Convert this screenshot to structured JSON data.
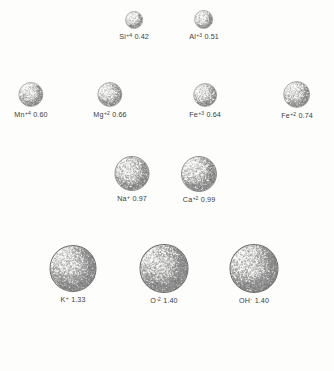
{
  "figure": {
    "background_color": "#fdfdfb",
    "text_color": "#3c3c3c",
    "sphere_outline_color": "#6b6b6b",
    "sphere_fill_color": "#fbfbf9",
    "sphere_stipple_color": "#8a8a8a",
    "scale_px_per_unit": 34.2
  },
  "chart_data": {
    "type": "scatter",
    "title": "",
    "xlabel": "",
    "ylabel": "",
    "rows": [
      {
        "row_index": 0,
        "y": 18,
        "ions": [
          {
            "symbol": "Si",
            "charge": "+4",
            "value": "0.42",
            "radius": 0.42,
            "cx": 134,
            "diameter": 17
          },
          {
            "symbol": "Al",
            "charge": "+3",
            "value": "0.51",
            "radius": 0.51,
            "cx": 204,
            "diameter": 18
          }
        ]
      },
      {
        "row_index": 1,
        "y": 93,
        "ions": [
          {
            "symbol": "Mn",
            "charge": "+4",
            "value": "0.60",
            "radius": 0.6,
            "cx": 31,
            "diameter": 24
          },
          {
            "symbol": "Mg",
            "charge": "+2",
            "value": "0.66",
            "radius": 0.66,
            "cx": 110,
            "diameter": 24
          },
          {
            "symbol": "Fe",
            "charge": "+3",
            "value": "0.64",
            "radius": 0.64,
            "cx": 205,
            "diameter": 23
          },
          {
            "symbol": "Fe",
            "charge": "+2",
            "value": "0.74",
            "radius": 0.74,
            "cx": 297,
            "diameter": 26
          }
        ]
      },
      {
        "row_index": 2,
        "y": 172,
        "ions": [
          {
            "symbol": "Na",
            "charge": "+",
            "value": "0.97",
            "radius": 0.97,
            "cx": 132,
            "diameter": 34
          },
          {
            "symbol": "Ca",
            "charge": "+2",
            "value": "0.99",
            "radius": 0.99,
            "cx": 199,
            "diameter": 35
          }
        ]
      },
      {
        "row_index": 3,
        "y": 267,
        "ions": [
          {
            "symbol": "K",
            "charge": "+",
            "value": "1.33",
            "radius": 1.33,
            "cx": 73,
            "diameter": 46
          },
          {
            "symbol": "O",
            "charge": "-2",
            "value": "1.40",
            "radius": 1.4,
            "cx": 164,
            "diameter": 48
          },
          {
            "symbol": "OH",
            "charge": "-",
            "value": "1.40",
            "radius": 1.4,
            "cx": 254,
            "diameter": 48
          }
        ]
      }
    ]
  }
}
